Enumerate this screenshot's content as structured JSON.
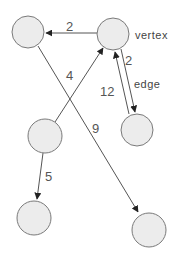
{
  "diagram": {
    "type": "weighted directed graph",
    "colors": {
      "node_fill": "#ececec",
      "node_stroke": "#7a7a7a",
      "edge": "#555555",
      "label": "#555555"
    },
    "nodes": [
      {
        "id": "A",
        "x": 28,
        "y": 32,
        "r": 16
      },
      {
        "id": "B",
        "x": 113,
        "y": 34,
        "r": 16
      },
      {
        "id": "C",
        "x": 137,
        "y": 130,
        "r": 16
      },
      {
        "id": "D",
        "x": 45,
        "y": 136,
        "r": 17
      },
      {
        "id": "E",
        "x": 34,
        "y": 218,
        "r": 17
      },
      {
        "id": "F",
        "x": 149,
        "y": 230,
        "r": 17
      }
    ],
    "edges": [
      {
        "from": "B",
        "to": "A",
        "weight": "2"
      },
      {
        "from": "D",
        "to": "B",
        "weight": "4"
      },
      {
        "from": "B",
        "to": "C",
        "weight": "2"
      },
      {
        "from": "C",
        "to": "B",
        "weight": "12"
      },
      {
        "from": "A",
        "to": "F",
        "weight": "9"
      },
      {
        "from": "D",
        "to": "E",
        "weight": "5"
      }
    ],
    "annotations": {
      "vertex_label": "vertex",
      "edge_label": "edge"
    }
  }
}
